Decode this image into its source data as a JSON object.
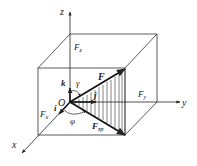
{
  "diagram": {
    "type": "3d-force-decomposition",
    "axes": {
      "x": "x",
      "y": "y",
      "z": "z"
    },
    "origin_label": "O",
    "unit_vectors": {
      "i": "i",
      "j": "j",
      "k": "k"
    },
    "force_labels": {
      "F": "F",
      "Fx": "F",
      "Fx_sub": "x",
      "Fy": "F",
      "Fy_sub": "y",
      "Fz": "F",
      "Fz_sub": "z",
      "Fxy": "F",
      "Fxy_sub": "xy"
    },
    "angles": {
      "gamma": "γ",
      "phi": "φ"
    },
    "colors": {
      "line": "#333333",
      "background": "#ffffff"
    }
  }
}
